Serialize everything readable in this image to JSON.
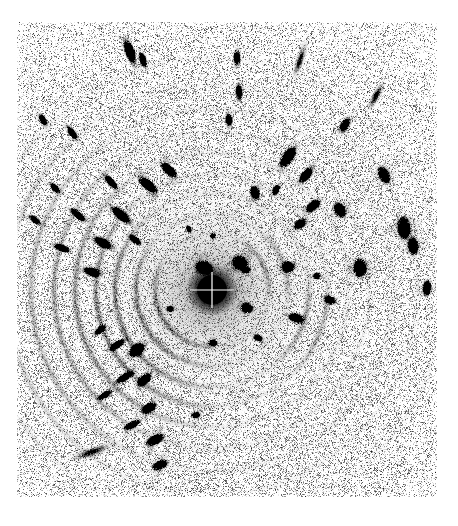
{
  "figure": {
    "kind": "diffraction-pattern",
    "modality": "x-ray-fiber-diffraction",
    "title": "",
    "caption": "",
    "width": 458,
    "height": 526,
    "background_color": "#ffffff",
    "ink_color": "#000000",
    "polarity": "inverted-grayscale-film"
  },
  "detector": {
    "frame": {
      "x": 17,
      "y": 22,
      "width": 420,
      "height": 475
    },
    "frame_border": "none",
    "margin_color": "#ffffff",
    "noise": {
      "description": "fine speckle film grain over entire detector area",
      "density": 0.3,
      "grain_min_gray": 70,
      "grain_max_gray": 225,
      "dust_specks": 900
    }
  },
  "beam_center": {
    "x": 212,
    "y": 290
  },
  "beamstop": {
    "label": "central beam stop",
    "center_x": 212,
    "center_y": 290,
    "radius": 15,
    "color": "#000000",
    "crosshair": {
      "present": true,
      "color": "#ffffff",
      "line_width": 1.2,
      "horizontal_half_length": 22,
      "vertical_half_length": 18
    }
  },
  "chart_data": {
    "type": "scatter",
    "xlabel": "detector x (px)",
    "ylabel": "detector y (px)",
    "xlim": [
      17,
      437
    ],
    "ylim": [
      22,
      497
    ],
    "grid": false,
    "legend": null,
    "annotations": [
      "concentric Debye-Scherrer rings centred on the beam stop",
      "arcs strongest in the upper-left and lower-left quadrants",
      "discrete Bragg reflections (lens-shaped spots) on several rings",
      "broad diffuse halo immediately around the beam stop"
    ],
    "rings": [
      {
        "name": "halo-1",
        "radius": 26,
        "intensity": 0.34,
        "width": 13,
        "kind": "diffuse-halo"
      },
      {
        "name": "halo-2",
        "radius": 39,
        "intensity": 0.28,
        "width": 11,
        "kind": "diffuse-halo"
      },
      {
        "name": "ring-1",
        "radius": 57,
        "intensity": 0.3,
        "width": 5.0,
        "kind": "powder-ring"
      },
      {
        "name": "ring-2",
        "radius": 76,
        "intensity": 0.26,
        "width": 4.6,
        "kind": "powder-ring"
      },
      {
        "name": "ring-3",
        "radius": 97,
        "intensity": 0.3,
        "width": 5.0,
        "kind": "powder-ring"
      },
      {
        "name": "ring-4",
        "radius": 116,
        "intensity": 0.26,
        "width": 4.6,
        "kind": "powder-ring"
      },
      {
        "name": "ring-5",
        "radius": 137,
        "intensity": 0.24,
        "width": 4.4,
        "kind": "powder-ring"
      },
      {
        "name": "ring-6",
        "radius": 158,
        "intensity": 0.2,
        "width": 4.2,
        "kind": "powder-ring"
      },
      {
        "name": "ring-7",
        "radius": 181,
        "intensity": 0.17,
        "width": 4.0,
        "kind": "powder-ring"
      },
      {
        "name": "ring-8",
        "radius": 205,
        "intensity": 0.13,
        "width": 3.8,
        "kind": "powder-ring"
      },
      {
        "name": "ring-9",
        "radius": 232,
        "intensity": 0.1,
        "width": 3.6,
        "kind": "powder-ring"
      }
    ],
    "arc_segments": [
      {
        "radius": 57,
        "theta_deg": 150,
        "span_deg": 130,
        "intensity": 0.55
      },
      {
        "radius": 57,
        "theta_deg": 335,
        "span_deg": 70,
        "intensity": 0.4
      },
      {
        "radius": 76,
        "theta_deg": 155,
        "span_deg": 140,
        "intensity": 0.55
      },
      {
        "radius": 76,
        "theta_deg": 340,
        "span_deg": 60,
        "intensity": 0.35
      },
      {
        "radius": 97,
        "theta_deg": 160,
        "span_deg": 150,
        "intensity": 0.6
      },
      {
        "radius": 97,
        "theta_deg": 20,
        "span_deg": 60,
        "intensity": 0.38
      },
      {
        "radius": 116,
        "theta_deg": 160,
        "span_deg": 150,
        "intensity": 0.58
      },
      {
        "radius": 116,
        "theta_deg": 20,
        "span_deg": 55,
        "intensity": 0.3
      },
      {
        "radius": 137,
        "theta_deg": 165,
        "span_deg": 150,
        "intensity": 0.5
      },
      {
        "radius": 158,
        "theta_deg": 168,
        "span_deg": 140,
        "intensity": 0.42
      },
      {
        "radius": 181,
        "theta_deg": 172,
        "span_deg": 130,
        "intensity": 0.33
      },
      {
        "radius": 205,
        "theta_deg": 175,
        "span_deg": 120,
        "intensity": 0.25
      },
      {
        "radius": 232,
        "theta_deg": 178,
        "span_deg": 100,
        "intensity": 0.18
      }
    ],
    "spots": [
      {
        "x": 204,
        "y": 268,
        "rx": 11,
        "ry": 8,
        "angle": 20,
        "intensity": 0.55
      },
      {
        "x": 240,
        "y": 263,
        "rx": 9,
        "ry": 7,
        "angle": 30,
        "intensity": 0.92
      },
      {
        "x": 247,
        "y": 308,
        "rx": 7,
        "ry": 6,
        "angle": 0,
        "intensity": 0.6
      },
      {
        "x": 213,
        "y": 236,
        "rx": 3,
        "ry": 3,
        "angle": 0,
        "intensity": 0.7
      },
      {
        "x": 213,
        "y": 343,
        "rx": 6,
        "ry": 4,
        "angle": 0,
        "intensity": 0.45
      },
      {
        "x": 170,
        "y": 309,
        "rx": 5,
        "ry": 4,
        "angle": 0,
        "intensity": 0.35
      },
      {
        "x": 148,
        "y": 185,
        "rx": 12,
        "ry": 5,
        "angle": 38,
        "intensity": 0.88
      },
      {
        "x": 169,
        "y": 170,
        "rx": 11,
        "ry": 5,
        "angle": 42,
        "intensity": 0.72
      },
      {
        "x": 121,
        "y": 215,
        "rx": 12,
        "ry": 5,
        "angle": 40,
        "intensity": 0.8
      },
      {
        "x": 103,
        "y": 243,
        "rx": 11,
        "ry": 5,
        "angle": 30,
        "intensity": 0.7
      },
      {
        "x": 92,
        "y": 272,
        "rx": 10,
        "ry": 5,
        "angle": 18,
        "intensity": 0.6
      },
      {
        "x": 135,
        "y": 240,
        "rx": 8,
        "ry": 4,
        "angle": 40,
        "intensity": 0.55
      },
      {
        "x": 111,
        "y": 182,
        "rx": 10,
        "ry": 4,
        "angle": 48,
        "intensity": 0.6
      },
      {
        "x": 78,
        "y": 215,
        "rx": 11,
        "ry": 4,
        "angle": 40,
        "intensity": 0.55
      },
      {
        "x": 62,
        "y": 248,
        "rx": 10,
        "ry": 4,
        "angle": 22,
        "intensity": 0.5
      },
      {
        "x": 55,
        "y": 188,
        "rx": 8,
        "ry": 4,
        "angle": 48,
        "intensity": 0.42
      },
      {
        "x": 35,
        "y": 220,
        "rx": 9,
        "ry": 4,
        "angle": 38,
        "intensity": 0.38
      },
      {
        "x": 72,
        "y": 133,
        "rx": 9,
        "ry": 4,
        "angle": 55,
        "intensity": 0.5
      },
      {
        "x": 43,
        "y": 120,
        "rx": 8,
        "ry": 4,
        "angle": 62,
        "intensity": 0.42
      },
      {
        "x": 130,
        "y": 52,
        "rx": 13,
        "ry": 5,
        "angle": 70,
        "intensity": 0.85
      },
      {
        "x": 143,
        "y": 60,
        "rx": 9,
        "ry": 4,
        "angle": 72,
        "intensity": 0.55
      },
      {
        "x": 229,
        "y": 120,
        "rx": 7,
        "ry": 4,
        "angle": 82,
        "intensity": 0.62
      },
      {
        "x": 239,
        "y": 92,
        "rx": 9,
        "ry": 4,
        "angle": 86,
        "intensity": 0.55
      },
      {
        "x": 237,
        "y": 58,
        "rx": 9,
        "ry": 4,
        "angle": 88,
        "intensity": 0.48
      },
      {
        "x": 255,
        "y": 193,
        "rx": 8,
        "ry": 5,
        "angle": 68,
        "intensity": 0.72
      },
      {
        "x": 288,
        "y": 157,
        "rx": 12,
        "ry": 6,
        "angle": 125,
        "intensity": 0.88
      },
      {
        "x": 306,
        "y": 175,
        "rx": 10,
        "ry": 5,
        "angle": 130,
        "intensity": 0.7
      },
      {
        "x": 276,
        "y": 190,
        "rx": 7,
        "ry": 4,
        "angle": 120,
        "intensity": 0.52
      },
      {
        "x": 313,
        "y": 206,
        "rx": 9,
        "ry": 5,
        "angle": 140,
        "intensity": 0.75
      },
      {
        "x": 300,
        "y": 224,
        "rx": 8,
        "ry": 5,
        "angle": 148,
        "intensity": 0.62
      },
      {
        "x": 288,
        "y": 267,
        "rx": 7,
        "ry": 6,
        "angle": 170,
        "intensity": 0.82
      },
      {
        "x": 296,
        "y": 318,
        "rx": 8,
        "ry": 5,
        "angle": 195,
        "intensity": 0.8
      },
      {
        "x": 340,
        "y": 210,
        "rx": 6,
        "ry": 9,
        "angle": 150,
        "intensity": 0.72
      },
      {
        "x": 360,
        "y": 268,
        "rx": 7,
        "ry": 10,
        "angle": 178,
        "intensity": 0.85
      },
      {
        "x": 345,
        "y": 125,
        "rx": 9,
        "ry": 5,
        "angle": 118,
        "intensity": 0.55
      },
      {
        "x": 384,
        "y": 175,
        "rx": 6,
        "ry": 10,
        "angle": 152,
        "intensity": 0.7
      },
      {
        "x": 404,
        "y": 228,
        "rx": 7,
        "ry": 12,
        "angle": 172,
        "intensity": 0.88
      },
      {
        "x": 413,
        "y": 246,
        "rx": 6,
        "ry": 10,
        "angle": 176,
        "intensity": 0.7
      },
      {
        "x": 427,
        "y": 288,
        "rx": 5,
        "ry": 9,
        "angle": 186,
        "intensity": 0.62
      },
      {
        "x": 330,
        "y": 300,
        "rx": 7,
        "ry": 5,
        "angle": 196,
        "intensity": 0.58
      },
      {
        "x": 317,
        "y": 276,
        "rx": 5,
        "ry": 4,
        "angle": 185,
        "intensity": 0.45
      },
      {
        "x": 137,
        "y": 350,
        "rx": 9,
        "ry": 6,
        "angle": 318,
        "intensity": 0.88
      },
      {
        "x": 144,
        "y": 380,
        "rx": 9,
        "ry": 5,
        "angle": 322,
        "intensity": 0.82
      },
      {
        "x": 149,
        "y": 408,
        "rx": 9,
        "ry": 5,
        "angle": 328,
        "intensity": 0.75
      },
      {
        "x": 125,
        "y": 377,
        "rx": 12,
        "ry": 4,
        "angle": 330,
        "intensity": 0.62
      },
      {
        "x": 117,
        "y": 345,
        "rx": 10,
        "ry": 4,
        "angle": 325,
        "intensity": 0.55
      },
      {
        "x": 155,
        "y": 440,
        "rx": 11,
        "ry": 5,
        "angle": 335,
        "intensity": 0.72
      },
      {
        "x": 160,
        "y": 465,
        "rx": 10,
        "ry": 5,
        "angle": 338,
        "intensity": 0.58
      },
      {
        "x": 132,
        "y": 425,
        "rx": 11,
        "ry": 4,
        "angle": 332,
        "intensity": 0.48
      },
      {
        "x": 105,
        "y": 395,
        "rx": 10,
        "ry": 4,
        "angle": 330,
        "intensity": 0.42
      },
      {
        "x": 100,
        "y": 330,
        "rx": 9,
        "ry": 4,
        "angle": 318,
        "intensity": 0.4
      },
      {
        "x": 196,
        "y": 415,
        "rx": 6,
        "ry": 4,
        "angle": 350,
        "intensity": 0.4
      },
      {
        "x": 246,
        "y": 270,
        "rx": 5,
        "ry": 4,
        "angle": 0,
        "intensity": 0.6
      },
      {
        "x": 258,
        "y": 338,
        "rx": 6,
        "ry": 4,
        "angle": 200,
        "intensity": 0.42
      },
      {
        "x": 189,
        "y": 229,
        "rx": 5,
        "ry": 3,
        "angle": 60,
        "intensity": 0.4
      }
    ],
    "flares": [
      {
        "x": 300,
        "y": 60,
        "rx": 22,
        "ry": 5,
        "angle": 108,
        "intensity": 0.1
      },
      {
        "x": 376,
        "y": 96,
        "rx": 18,
        "ry": 5,
        "angle": 118,
        "intensity": 0.12
      },
      {
        "x": 92,
        "y": 452,
        "rx": 26,
        "ry": 6,
        "angle": 340,
        "intensity": 0.1
      }
    ]
  },
  "ui": {
    "controls_present": false,
    "labels": [],
    "scalebar": null,
    "axes_visible": false
  }
}
